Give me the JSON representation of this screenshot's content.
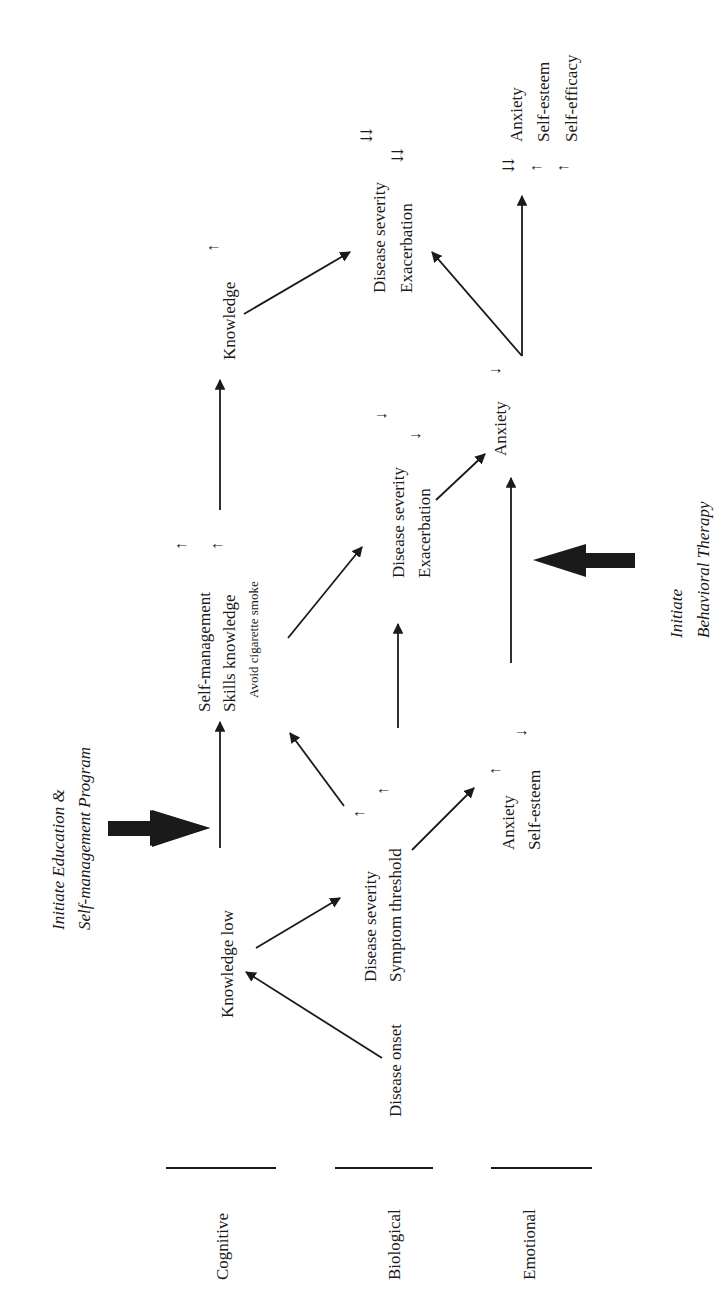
{
  "diagram": {
    "orientation": "rotated-90-ccw",
    "rows": {
      "cognitive": "Cognitive",
      "biological": "Biological",
      "emotional": "Emotional"
    },
    "nodes": {
      "disease_onset": "Disease onset",
      "knowledge_low": "Knowledge low",
      "severity1_line1": "Disease  severity",
      "severity1_line2": "Symptom threshold",
      "emo1_line1": "Anxiety",
      "emo1_line2": "Self-esteem",
      "selfmgmt_line1": "Self-management",
      "selfmgmt_line2": "Skills knowledge",
      "selfmgmt_line3": "Avoid cigarette smoke",
      "severity2_line1": "Disease severity",
      "severity2_line2": "Exacerbation",
      "anxiety2": "Anxiety",
      "knowledge_top": "Knowledge",
      "severity3_line1": "Disease severity",
      "severity3_line2": "Exacerbation",
      "emo3_line1": "Anxiety",
      "emo3_line2": "Self-esteem",
      "emo3_line3": "Self-efficacy"
    },
    "indicators": {
      "up": "↑",
      "down": "↓",
      "double_down": "⇊"
    },
    "interventions": {
      "education_line1": "Initiate  Education &",
      "education_line2": "Self-management Program",
      "behavioral_line1": "Initiate",
      "behavioral_line2": "Behavioral Therapy"
    }
  }
}
